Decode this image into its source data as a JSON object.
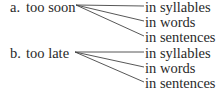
{
  "groups": [
    {
      "label": "a.",
      "text": "too soon",
      "branches": [
        "in syllables",
        "in words",
        "in sentences"
      ]
    },
    {
      "label": "b.",
      "text": "too late",
      "branches": [
        "in syllables",
        "in words",
        "in sentences"
      ]
    }
  ]
}
